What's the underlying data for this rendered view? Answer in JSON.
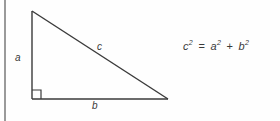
{
  "figure": {
    "type": "geometry-diagram",
    "background_color": "#fefefe",
    "stroke_color": "#3a3a3a",
    "rule_color": "#9a9a9a"
  },
  "triangle": {
    "vertices": {
      "apex": [
        32,
        11
      ],
      "right_angle": [
        32,
        99
      ],
      "base_right": [
        168,
        99
      ]
    },
    "right_angle_marker_size": 9,
    "labels": {
      "leg_vertical": "a",
      "hypotenuse": "c",
      "leg_horizontal": "b"
    }
  },
  "equation": {
    "base_c": "c",
    "exp_c": "2",
    "equals": "=",
    "base_a": "a",
    "exp_a": "2",
    "plus": "+",
    "base_b": "b",
    "exp_b": "2",
    "plain_text": "c2 = a2 + b2"
  }
}
